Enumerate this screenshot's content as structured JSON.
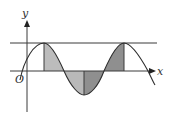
{
  "diagram": {
    "type": "sine-curve-area-shading",
    "labels": {
      "y_axis": "y",
      "x_axis": "x",
      "origin": "O"
    },
    "colors": {
      "line": "#3a3a3a",
      "shade_light": "#b9b9b9",
      "shade_dark": "#8e8e8e",
      "background": "#ffffff"
    },
    "elements": [
      "y-axis with arrow",
      "x-axis with arrow",
      "horizontal line tangent to curve maxima",
      "sinusoidal curve",
      "vertical segment at first maximum",
      "vertical segment at minimum",
      "vertical segment at second maximum",
      "four shaded regions between curve and x-axis"
    ]
  }
}
